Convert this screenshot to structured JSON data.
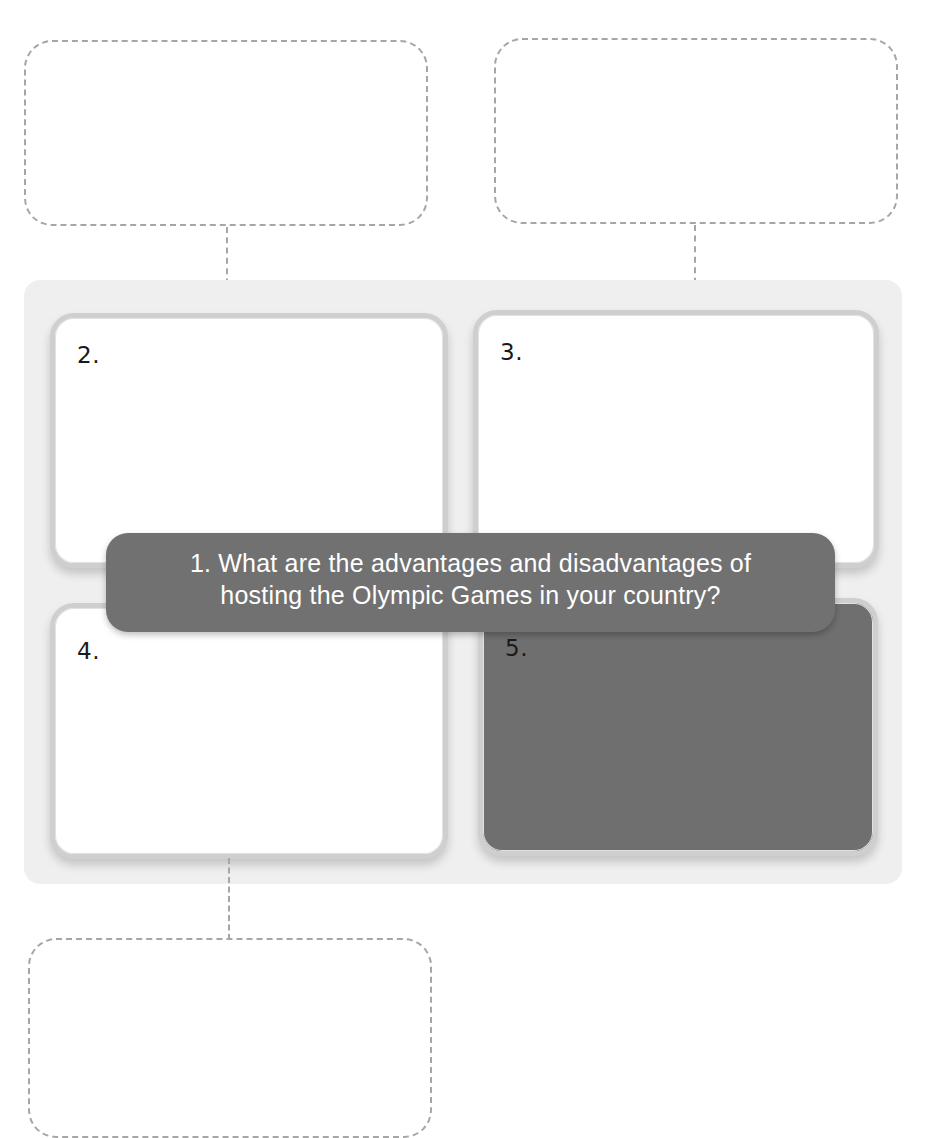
{
  "header": {
    "fragment": "Units … 1"
  },
  "question": {
    "line1": "1. What are the advantages and disadvantages of",
    "line2": "hosting the Olympic Games in your country?"
  },
  "cards": [
    {
      "label": "2."
    },
    {
      "label": "3."
    },
    {
      "label": "4."
    },
    {
      "label": "5."
    }
  ],
  "answer_boxes": [
    {
      "position": "top-left",
      "text": ""
    },
    {
      "position": "top-right",
      "text": ""
    },
    {
      "position": "bottom-left",
      "text": ""
    }
  ],
  "colors": {
    "panel": "#efefef",
    "card_border": "#cfcfcf",
    "question_bg": "#717171",
    "dark_card": "#6f6f6f",
    "dashed": "#a6a6a6"
  }
}
